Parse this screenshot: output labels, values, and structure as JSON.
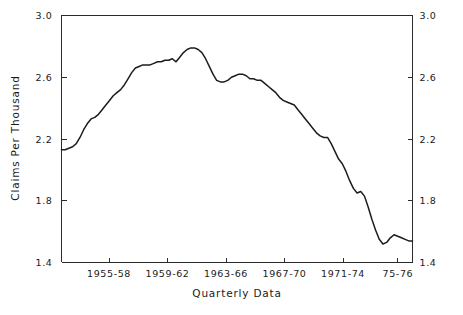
{
  "chart_data": {
    "type": "line",
    "title": "",
    "xlabel": "Quarterly Data",
    "ylabel": "Claims Per Thousand",
    "ylim": [
      1.4,
      3.0
    ],
    "y_ticks": [
      "1.4",
      "1.8",
      "2.2",
      "2.6",
      "3.0"
    ],
    "y_tick_values": [
      1.4,
      1.8,
      2.2,
      2.6,
      3.0
    ],
    "y_axis_right_ticks": [
      "1.4",
      "1.8",
      "2.2",
      "2.6",
      "3.0"
    ],
    "x_tick_labels": [
      "1955-58",
      "1959-62",
      "1963-66",
      "1967-70",
      "1971-74",
      "75-76"
    ],
    "x_tick_positions": [
      6.5,
      14.5,
      22.5,
      30.5,
      38.5,
      46.0
    ],
    "grid": false,
    "legend": null,
    "series": [
      {
        "name": "Claims Per Thousand",
        "x": [
          0,
          1,
          2,
          3,
          4,
          5,
          6,
          7,
          8,
          9,
          10,
          11,
          12,
          13,
          14,
          15,
          16,
          17,
          18,
          19,
          20,
          21,
          22,
          23,
          24,
          25,
          26,
          27,
          28,
          29,
          30,
          31,
          32,
          33,
          34,
          35,
          36,
          37,
          38,
          39,
          40,
          41,
          42,
          43,
          44,
          45,
          46,
          47,
          48,
          49,
          50,
          51,
          52,
          53,
          54,
          55,
          56,
          57,
          58,
          59,
          60,
          61,
          62,
          63,
          64,
          65,
          66,
          67,
          68,
          69,
          70,
          71,
          72,
          73,
          74,
          75,
          76,
          77,
          78,
          79,
          80,
          81,
          82,
          83,
          84,
          85,
          86,
          87
        ],
        "values": [
          2.13,
          2.13,
          2.14,
          2.15,
          2.17,
          2.21,
          2.26,
          2.3,
          2.33,
          2.34,
          2.36,
          2.39,
          2.42,
          2.45,
          2.48,
          2.5,
          2.52,
          2.55,
          2.59,
          2.63,
          2.66,
          2.67,
          2.68,
          2.68,
          2.68,
          2.69,
          2.7,
          2.7,
          2.71,
          2.71,
          2.72,
          2.7,
          2.73,
          2.76,
          2.78,
          2.79,
          2.79,
          2.78,
          2.76,
          2.72,
          2.67,
          2.62,
          2.58,
          2.57,
          2.57,
          2.58,
          2.6,
          2.61,
          2.62,
          2.62,
          2.61,
          2.59,
          2.59,
          2.58,
          2.58,
          2.56,
          2.54,
          2.52,
          2.5,
          2.47,
          2.45,
          2.44,
          2.43,
          2.42,
          2.39,
          2.36,
          2.33,
          2.3,
          2.27,
          2.24,
          2.22,
          2.21,
          2.21,
          2.17,
          2.12,
          2.07,
          2.04,
          1.99,
          1.93,
          1.88,
          1.85,
          1.86,
          1.83,
          1.76,
          1.68,
          1.61,
          1.55,
          1.52
        ],
        "values_tail": [
          1.53,
          1.56,
          1.58,
          1.57,
          1.56,
          1.55,
          1.54,
          1.54
        ]
      }
    ],
    "data_points_count": 96,
    "x_range_quarters": [
      0,
      95
    ]
  },
  "axes": {
    "left_axis_name": "claims-per-thousand",
    "right_axis_name": "claims-per-thousand-mirror",
    "bottom_axis_name": "quarterly-data"
  }
}
